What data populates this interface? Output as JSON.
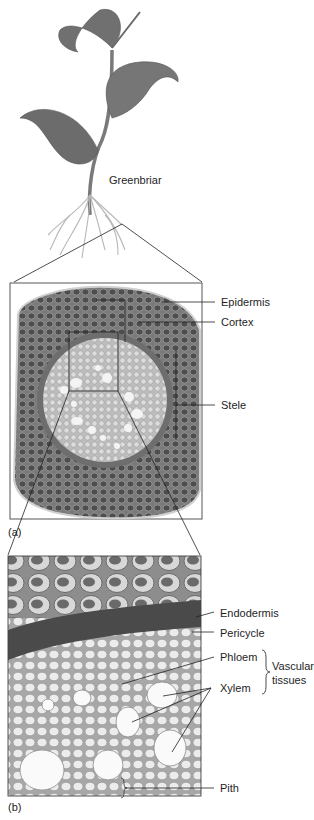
{
  "figure": {
    "plant": {
      "name": "Greenbriar"
    },
    "panel_a": {
      "tag": "(a)",
      "labels": [
        {
          "text": "Epidermis"
        },
        {
          "text": "Cortex"
        },
        {
          "text": "Stele"
        }
      ]
    },
    "panel_b": {
      "tag": "(b)",
      "labels": [
        {
          "text": "Endodermis"
        },
        {
          "text": "Pericycle"
        },
        {
          "text": "Phloem"
        },
        {
          "text": "Xylem"
        },
        {
          "text": "Pith"
        }
      ],
      "group_label": {
        "line1": "Vascular",
        "line2": "tissues"
      }
    },
    "colors": {
      "leaf": "#6f6f6f",
      "stem": "#8a8a8a",
      "root": "#c9c9c9",
      "cortex": "#5e5e5e",
      "stele": "#cfcfcf",
      "endodermis": "#4a4a4a",
      "cells_light": "#e6e6e6",
      "line": "#222222"
    }
  }
}
